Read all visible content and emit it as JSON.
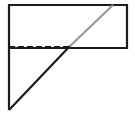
{
  "figure": {
    "background_color": "#ffffff",
    "canvas": {
      "width": 135,
      "height": 118
    },
    "colors": {
      "solid_black": "#1a1a1a",
      "diagonal_gray": "#999999",
      "dashed_black": "#1a1a1a"
    },
    "stroke_widths": {
      "rectangle": 2.2,
      "black_diagonal": 2.2,
      "gray_diagonal": 2.2,
      "dashed": 2.0,
      "left_leg": 2.2
    },
    "dash_pattern": "6 3",
    "points": {
      "rect_top_left": {
        "x": 9,
        "y": 5
      },
      "rect_top_right": {
        "x": 127,
        "y": 5
      },
      "rect_bottom_right": {
        "x": 127,
        "y": 48
      },
      "rect_bottom_left": {
        "x": 9,
        "y": 48
      },
      "intersection": {
        "x": 68,
        "y": 48
      },
      "gray_top_end": {
        "x": 113,
        "y": 5
      },
      "triangle_apex": {
        "x": 9,
        "y": 110
      }
    },
    "shapes": [
      {
        "name": "rectangle",
        "type": "rect",
        "style": "solid",
        "color": "#1a1a1a"
      },
      {
        "name": "dashed-segment",
        "type": "line",
        "style": "dashed",
        "color": "#1a1a1a"
      },
      {
        "name": "gray-diagonal",
        "type": "line",
        "style": "solid",
        "color": "#999999"
      },
      {
        "name": "black-diagonal",
        "type": "line",
        "style": "solid",
        "color": "#1a1a1a"
      },
      {
        "name": "left-vertical-leg",
        "type": "line",
        "style": "solid",
        "color": "#1a1a1a"
      }
    ]
  }
}
